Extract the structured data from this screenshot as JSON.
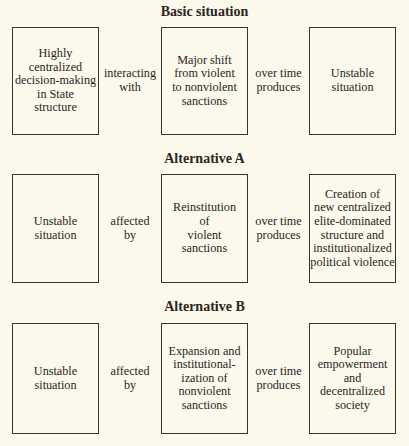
{
  "sections": [
    {
      "title": "Basic situation",
      "box1": "Highly\ncentralized\ndecision-making\nin State\nstructure",
      "connector1": "interacting\nwith",
      "box2": "Major shift\nfrom violent\nto nonviolent\nsanctions",
      "connector2": "over time\nproduces",
      "box3": "Unstable\nsituation"
    },
    {
      "title": "Alternative A",
      "box1": "Unstable\nsituation",
      "connector1": "affected\nby",
      "box2": "Reinstitution\nof\nviolent\nsanctions",
      "connector2": "over time\nproduces",
      "box3": "Creation of\nnew centralized\nelite-dominated\nstructure and\ninstitutionalized\npolitical violence"
    },
    {
      "title": "Alternative B",
      "box1": "Unstable\nsituation",
      "connector1": "affected\nby",
      "box2": "Expansion and\ninstitutional-\nization of\nnonviolent\nsanctions",
      "connector2": "over time\nproduces",
      "box3": "Popular\nempowerment\nand\ndecentralized\nsociety"
    }
  ]
}
